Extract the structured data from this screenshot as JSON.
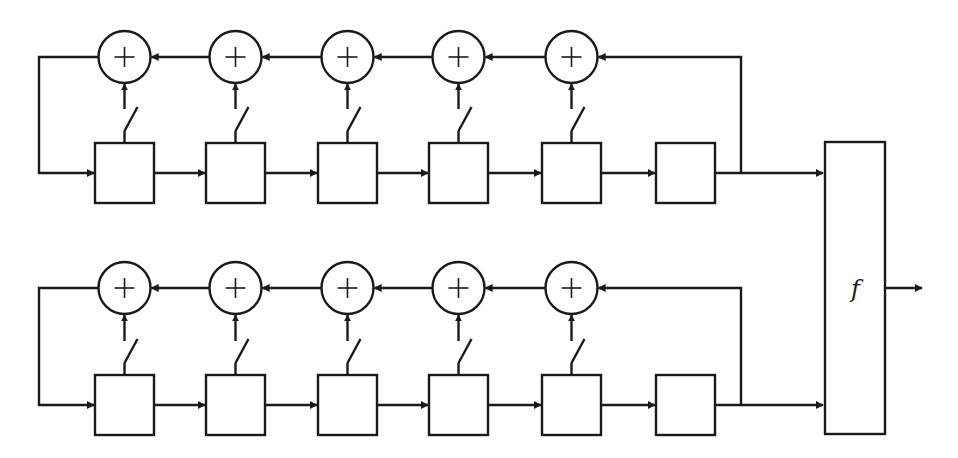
{
  "diagram": {
    "type": "nonlinear combination generator (two LFSRs feeding a combining function)",
    "colors": {
      "stroke": "#1a1a1a",
      "background": "#ffffff"
    },
    "adder_symbol": "+",
    "combiner": {
      "label": "f"
    },
    "lfsrs": [
      {
        "name": "top",
        "adder_cy": 57,
        "reg_top": 143,
        "wire_y": 173,
        "adders": 5,
        "registers": 6,
        "taps": 5
      },
      {
        "name": "bottom",
        "adder_cy": 288,
        "reg_top": 375,
        "wire_y": 405,
        "adders": 5,
        "registers": 6,
        "taps": 5
      }
    ],
    "output_arrow": {
      "y": 288
    }
  }
}
